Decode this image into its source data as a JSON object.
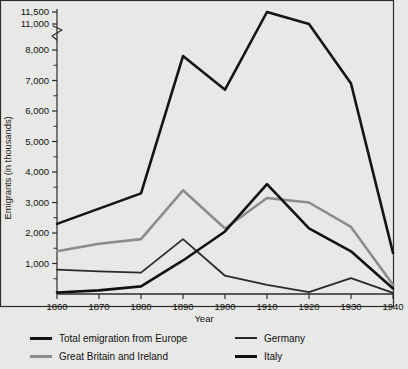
{
  "chart_data": {
    "type": "line",
    "title": "",
    "xlabel": "Year",
    "ylabel": "Emigrants (in thousands)",
    "x": [
      1860,
      1870,
      1880,
      1890,
      1900,
      1910,
      1920,
      1930,
      1940
    ],
    "xticklabels": [
      "1860",
      "1870",
      "1880",
      "1890",
      "1900",
      "1910",
      "1920",
      "1930",
      "1940"
    ],
    "yticklabels": [
      "1,000",
      "2,000",
      "3,000",
      "4,000",
      "5,000",
      "6,000",
      "7,000",
      "8,000",
      "11,000",
      "11,500"
    ],
    "ytickvalues": [
      1000,
      2000,
      3000,
      4000,
      5000,
      6000,
      7000,
      8000,
      11000,
      11500
    ],
    "ylim": [
      0,
      11500
    ],
    "axis_break": {
      "between": [
        8000,
        11000
      ],
      "label": "y-axis-break"
    },
    "grid": false,
    "legend_position": "below-plot",
    "series": [
      {
        "name": "Total emigration from Europe",
        "color": "#141414",
        "width": 2.6,
        "values": [
          2300,
          2800,
          3300,
          7800,
          6700,
          11500,
          9100,
          6900,
          1350
        ]
      },
      {
        "name": "Great Britain and Ireland",
        "color": "#8c8c8c",
        "width": 2.6,
        "values": [
          1400,
          1650,
          1800,
          3400,
          2150,
          3150,
          3000,
          2200,
          300
        ]
      },
      {
        "name": "Germany",
        "color": "#2a2a2a",
        "width": 1.8,
        "values": [
          800,
          740,
          700,
          1800,
          600,
          300,
          60,
          520,
          40
        ]
      },
      {
        "name": "Italy",
        "color": "#111111",
        "width": 2.6,
        "values": [
          50,
          120,
          250,
          1100,
          2050,
          3600,
          2150,
          1400,
          180
        ]
      }
    ]
  },
  "axis": {
    "ylabel": "Emigrants (in thousands)",
    "xlabel": "Year"
  },
  "legend": {
    "items": [
      {
        "label": "Total emigration from Europe",
        "color": "#141414",
        "thickness": "3px"
      },
      {
        "label": "Great Britain and Ireland",
        "color": "#8c8c8c",
        "thickness": "3px"
      },
      {
        "label": "Germany",
        "color": "#2a2a2a",
        "thickness": "2px"
      },
      {
        "label": "Italy",
        "color": "#111111",
        "thickness": "3px"
      }
    ]
  }
}
